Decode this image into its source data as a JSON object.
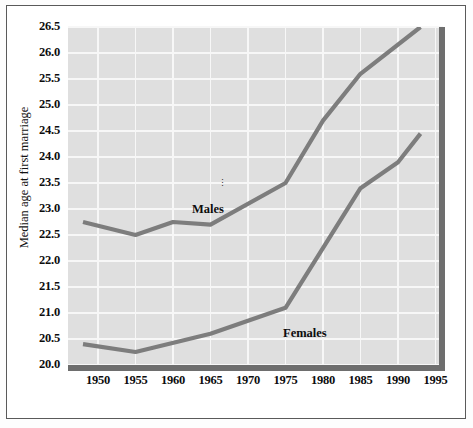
{
  "chart_data": {
    "type": "line",
    "title": "",
    "xlabel": "",
    "ylabel": "Median age at first marriage",
    "xlim": [
      1946,
      1996
    ],
    "ylim": [
      20.0,
      26.5
    ],
    "grid": true,
    "legend": "inline-labels",
    "x_ticks": [
      1950,
      1955,
      1960,
      1965,
      1970,
      1975,
      1980,
      1985,
      1990,
      1995
    ],
    "y_ticks": [
      20.0,
      20.5,
      21.0,
      21.5,
      22.0,
      22.5,
      23.0,
      23.5,
      24.0,
      24.5,
      25.0,
      25.5,
      26.0,
      26.5
    ],
    "y_tick_labels": [
      "20.0",
      "20.5",
      "21.0",
      "21.5",
      "22.0",
      "22.5",
      "23.0",
      "23.5",
      "24.0",
      "24.5",
      "25.0",
      "25.5",
      "26.0",
      "26.5"
    ],
    "x_tick_labels": [
      "1950",
      "1955",
      "1960",
      "1965",
      "1970",
      "1975",
      "1980",
      "1985",
      "1990",
      "1995"
    ],
    "series": [
      {
        "name": "Males",
        "label": "Males",
        "color": "#7d7d7d",
        "x": [
          1948,
          1955,
          1960,
          1965,
          1975,
          1980,
          1985,
          1993
        ],
        "values": [
          22.75,
          22.5,
          22.75,
          22.7,
          23.5,
          24.7,
          25.6,
          26.5
        ]
      },
      {
        "name": "Females",
        "label": "Females",
        "color": "#7d7d7d",
        "x": [
          1948,
          1955,
          1965,
          1975,
          1985,
          1990,
          1993
        ],
        "values": [
          20.4,
          20.25,
          20.6,
          21.1,
          23.4,
          23.9,
          24.45
        ]
      }
    ]
  },
  "colors": {
    "plot_background": "#dfdfdf",
    "gridline": "#f7f7f7",
    "axis_rule": "#6e6e6e",
    "series_line": "#7d7d7d",
    "frame_border": "#5a5a5a",
    "text": "#0d0d0d"
  }
}
